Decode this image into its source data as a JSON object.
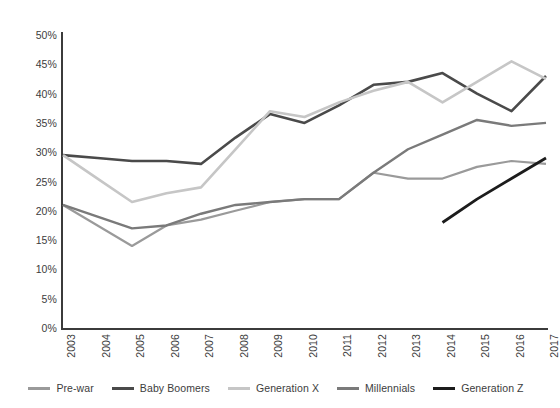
{
  "chart_data": {
    "type": "line",
    "title": "",
    "subtitle": "",
    "xlabel": "",
    "ylabel": "",
    "x": [
      "2003",
      "2004",
      "2005",
      "2006",
      "2007",
      "2008",
      "2009",
      "2010",
      "2011",
      "2012",
      "2013",
      "2014",
      "2015",
      "2016",
      "2017"
    ],
    "ylim": [
      0,
      50
    ],
    "ytick_labels": [
      "0%",
      "5%",
      "10%",
      "15%",
      "20%",
      "25%",
      "30%",
      "35%",
      "40%",
      "45%",
      "50%"
    ],
    "ytick_values": [
      0,
      5,
      10,
      15,
      20,
      25,
      30,
      35,
      40,
      45,
      50
    ],
    "grid": false,
    "legend_position": "bottom",
    "value_suffix": "%",
    "series": [
      {
        "name": "Pre-war",
        "color": "#9a9a9a",
        "width": 2.2,
        "values": [
          21.0,
          17.5,
          14.0,
          17.5,
          18.5,
          20.0,
          21.5,
          22.0,
          22.0,
          26.5,
          25.5,
          25.5,
          27.5,
          28.5,
          28.0
        ]
      },
      {
        "name": "Baby Boomers",
        "color": "#4a4a4a",
        "width": 2.6,
        "values": [
          29.5,
          29.0,
          28.5,
          28.5,
          28.0,
          32.5,
          36.5,
          35.0,
          38.0,
          41.5,
          42.0,
          43.5,
          40.0,
          37.0,
          43.0
        ]
      },
      {
        "name": "Generation X",
        "color": "#c6c6c6",
        "width": 2.6,
        "values": [
          29.5,
          25.5,
          21.5,
          23.0,
          24.0,
          30.5,
          37.0,
          36.0,
          38.5,
          40.5,
          42.0,
          38.5,
          42.0,
          45.5,
          42.5
        ]
      },
      {
        "name": "Millennials",
        "color": "#7a7a7a",
        "width": 2.4,
        "values": [
          21.0,
          19.0,
          17.0,
          17.5,
          19.5,
          21.0,
          21.5,
          22.0,
          22.0,
          26.5,
          30.5,
          33.0,
          35.5,
          34.5,
          35.0
        ]
      },
      {
        "name": "Generation Z",
        "color": "#1c1c1c",
        "width": 2.8,
        "values": [
          null,
          null,
          null,
          null,
          null,
          null,
          null,
          null,
          null,
          null,
          null,
          18.0,
          22.0,
          25.5,
          29.0
        ]
      }
    ]
  },
  "legend": {
    "items": [
      {
        "label": "Pre-war",
        "color": "#9a9a9a"
      },
      {
        "label": "Baby Boomers",
        "color": "#4a4a4a"
      },
      {
        "label": "Generation X",
        "color": "#c6c6c6"
      },
      {
        "label": "Millennials",
        "color": "#7a7a7a"
      },
      {
        "label": "Generation Z",
        "color": "#1c1c1c"
      }
    ]
  },
  "axes": {
    "y_tick_labels": [
      "50%",
      "45%",
      "40%",
      "35%",
      "30%",
      "25%",
      "20%",
      "15%",
      "10%",
      "5%",
      "0%"
    ],
    "x_tick_labels": [
      "2003",
      "2004",
      "2005",
      "2006",
      "2007",
      "2008",
      "2009",
      "2010",
      "2011",
      "2012",
      "2013",
      "2014",
      "2015",
      "2016",
      "2017"
    ],
    "axis_color": "#3b3b3b"
  }
}
